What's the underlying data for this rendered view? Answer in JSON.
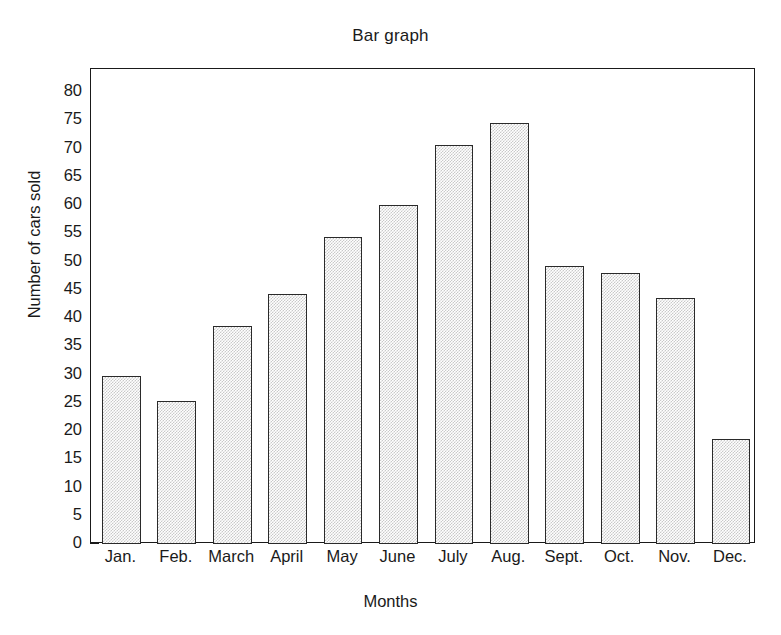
{
  "chart_data": {
    "type": "bar",
    "title": "Bar graph",
    "xlabel": "Months",
    "ylabel": "Number of cars sold",
    "categories": [
      "Jan.",
      "Feb.",
      "March",
      "April",
      "May",
      "June",
      "July",
      "Aug.",
      "Sept.",
      "Oct.",
      "Nov.",
      "Dec."
    ],
    "values": [
      29.8,
      25.3,
      38.5,
      44.2,
      54.3,
      60.0,
      70.6,
      74.5,
      49.2,
      48.0,
      43.5,
      18.5
    ],
    "ylim": [
      0,
      80
    ],
    "ytick_step": 5,
    "yticks": [
      0,
      5,
      10,
      15,
      20,
      25,
      30,
      35,
      40,
      45,
      50,
      55,
      60,
      65,
      70,
      75,
      80
    ],
    "ytick_labels": [
      "0",
      "5",
      "10",
      "15",
      "20",
      "25",
      "30",
      "35",
      "40",
      "45",
      "50",
      "55",
      "60",
      "65",
      "70",
      "75",
      "80"
    ],
    "grid": false,
    "legend": null,
    "bar_fill": "#c9c9c9",
    "bar_edge": "#2a2a2a",
    "axis_color": "#1a1a1a",
    "background": "#ffffff"
  }
}
